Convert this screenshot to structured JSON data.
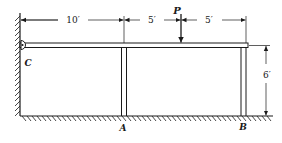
{
  "diagram": {
    "type": "structural-frame",
    "colors": {
      "line": "#1a1a1a",
      "background": "#ffffff"
    },
    "labels": {
      "load": "P",
      "pin_support": "C",
      "post_left": "A",
      "post_right": "B"
    },
    "dimensions": {
      "span_c_to_a": "10′",
      "span_a_to_p": "5′",
      "span_p_to_b": "5′",
      "height": "6′"
    }
  }
}
